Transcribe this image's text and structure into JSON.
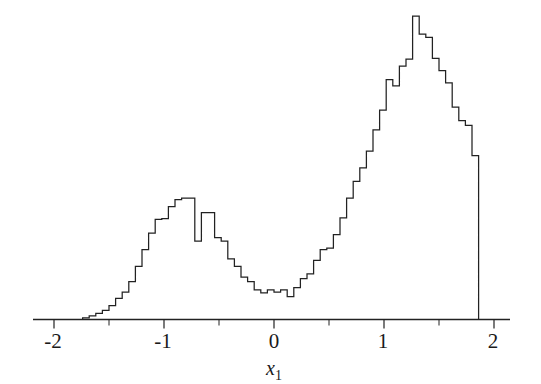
{
  "figure": {
    "background_color": "#ffffff",
    "line_color": "#222222"
  },
  "axis": {
    "x_title": "x",
    "x_title_subscript": "1",
    "tick_labels": [
      "-2",
      "-1",
      "0",
      "1",
      "2"
    ],
    "minor_ticks_between": 1
  },
  "chart_data": {
    "type": "bar",
    "title": "",
    "subtitle": "",
    "xlabel": "x₁",
    "ylabel": "",
    "grid": false,
    "legend": null,
    "xlim": [
      -2.2,
      2.2
    ],
    "ylim": [
      0,
      1.0
    ],
    "xticks": [
      -2,
      -1,
      0,
      1,
      2
    ],
    "xtick_labels": [
      "-2",
      "-1",
      "0",
      "1",
      "2"
    ],
    "yticks": [],
    "ytick_labels": [],
    "bin_width": 0.06,
    "bin_left_edges": [
      -1.74,
      -1.68,
      -1.62,
      -1.56,
      -1.5,
      -1.44,
      -1.38,
      -1.32,
      -1.26,
      -1.2,
      -1.14,
      -1.08,
      -1.02,
      -0.96,
      -0.9,
      -0.84,
      -0.78,
      -0.72,
      -0.66,
      -0.6,
      -0.54,
      -0.48,
      -0.42,
      -0.36,
      -0.3,
      -0.24,
      -0.18,
      -0.12,
      -0.06,
      0.0,
      0.06,
      0.12,
      0.18,
      0.24,
      0.3,
      0.36,
      0.42,
      0.48,
      0.54,
      0.6,
      0.66,
      0.72,
      0.78,
      0.84,
      0.9,
      0.96,
      1.02,
      1.08,
      1.14,
      1.2,
      1.26,
      1.32,
      1.38,
      1.44,
      1.5,
      1.56,
      1.62,
      1.68,
      1.74,
      1.8
    ],
    "values": [
      0.005,
      0.012,
      0.02,
      0.03,
      0.046,
      0.07,
      0.09,
      0.125,
      0.175,
      0.23,
      0.285,
      0.33,
      0.332,
      0.372,
      0.395,
      0.4,
      0.4,
      0.258,
      0.352,
      0.352,
      0.27,
      0.258,
      0.2,
      0.175,
      0.14,
      0.125,
      0.098,
      0.088,
      0.098,
      0.09,
      0.098,
      0.075,
      0.105,
      0.135,
      0.15,
      0.195,
      0.23,
      0.235,
      0.28,
      0.335,
      0.4,
      0.455,
      0.5,
      0.555,
      0.625,
      0.69,
      0.79,
      0.77,
      0.835,
      0.858,
      1.0,
      0.94,
      0.93,
      0.86,
      0.82,
      0.78,
      0.7,
      0.655,
      0.64,
      0.54
    ],
    "series": [
      {
        "name": "x1 histogram",
        "values": [
          0.005,
          0.012,
          0.02,
          0.03,
          0.046,
          0.07,
          0.09,
          0.125,
          0.175,
          0.23,
          0.285,
          0.33,
          0.332,
          0.372,
          0.395,
          0.4,
          0.4,
          0.258,
          0.352,
          0.352,
          0.27,
          0.258,
          0.2,
          0.175,
          0.14,
          0.125,
          0.098,
          0.088,
          0.098,
          0.09,
          0.098,
          0.075,
          0.105,
          0.135,
          0.15,
          0.195,
          0.23,
          0.235,
          0.28,
          0.335,
          0.4,
          0.455,
          0.5,
          0.555,
          0.625,
          0.69,
          0.79,
          0.77,
          0.835,
          0.858,
          1.0,
          0.94,
          0.93,
          0.86,
          0.82,
          0.78,
          0.7,
          0.655,
          0.64,
          0.54
        ]
      }
    ],
    "modes": [
      {
        "center": -0.95,
        "peak_value": 0.4
      },
      {
        "center": 0.95,
        "peak_value": 1.0
      }
    ],
    "valley": {
      "center": -0.05,
      "value": 0.085
    },
    "data_range": {
      "min": -1.74,
      "max": 1.8
    }
  }
}
